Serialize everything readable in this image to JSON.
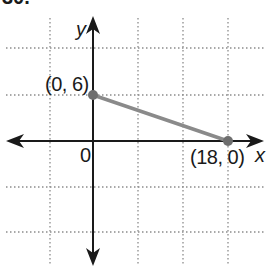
{
  "problem": {
    "number_label": "30."
  },
  "graph": {
    "axis_labels": {
      "x": "x",
      "y": "y"
    },
    "origin_label": "0",
    "points": [
      {
        "label": "(0, 6)",
        "x": 0,
        "y": 6
      },
      {
        "label": "(18, 0)",
        "x": 18,
        "y": 0
      }
    ],
    "segment": {
      "from": [
        0,
        6
      ],
      "to": [
        18,
        0
      ],
      "color": "#8a8a8a"
    },
    "grid": {
      "style": "dotted",
      "units_per_cell": 6,
      "x_lines": [
        -6,
        0,
        6,
        12,
        18
      ],
      "y_lines": [
        12,
        6,
        0,
        -6,
        -12
      ]
    },
    "colors": {
      "axis": "#1a1a1a",
      "grid": "#8c8c8c",
      "point": "#6e6e6e",
      "segment": "#8a8a8a"
    }
  }
}
